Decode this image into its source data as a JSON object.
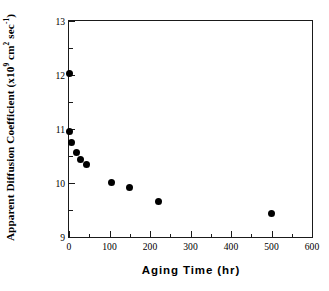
{
  "chart_data": {
    "type": "scatter",
    "title": "",
    "xlabel": "Aging  Time  (hr)",
    "ylabel_plain": "Apparent Diffusion Coefficient (x10^9 cm^2 sec^-1)",
    "ylabel_parts": {
      "lead": "Apparent Diffusion Coefficient (x10",
      "exp1": "9",
      "mid": " cm",
      "exp2": "2",
      "tail": " sec",
      "exp3": "-1",
      "close": ")"
    },
    "xlim": [
      0,
      600
    ],
    "ylim": [
      9,
      13
    ],
    "x_ticks": [
      0,
      100,
      200,
      300,
      400,
      500,
      600
    ],
    "x_tick_labels": [
      "0",
      "100",
      "200",
      "300",
      "400",
      "500",
      "600"
    ],
    "x_minor_ticks": [
      50,
      150,
      250,
      350,
      450,
      550
    ],
    "y_ticks": [
      9,
      10,
      11,
      12,
      13
    ],
    "y_tick_labels": [
      "9",
      "10",
      "11",
      "12",
      "13"
    ],
    "y_minor_ticks": [
      9.5,
      10.5,
      11.5,
      12.5
    ],
    "grid": false,
    "legend": null,
    "marker": "filled-circle",
    "marker_color": "#000000",
    "frame_color": "#1a1a1a",
    "points": [
      {
        "x": 0,
        "y": 12.03
      },
      {
        "x": 0,
        "y": 10.95
      },
      {
        "x": 5,
        "y": 10.75
      },
      {
        "x": 18,
        "y": 10.57
      },
      {
        "x": 28,
        "y": 10.44
      },
      {
        "x": 42,
        "y": 10.34
      },
      {
        "x": 105,
        "y": 10.01
      },
      {
        "x": 150,
        "y": 9.92
      },
      {
        "x": 222,
        "y": 9.65
      },
      {
        "x": 500,
        "y": 9.43
      }
    ]
  }
}
